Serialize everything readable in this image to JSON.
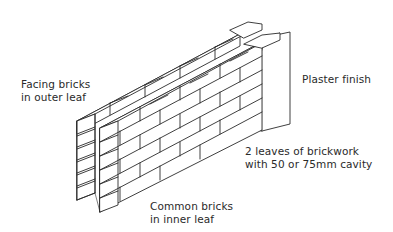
{
  "diagram": {
    "stroke_color": "#2a2a2a",
    "background": "#ffffff",
    "components": [
      "outer leaf",
      "inner leaf",
      "cavity",
      "plaster finish"
    ]
  },
  "labels": {
    "facing": {
      "line1": "Facing bricks",
      "line2": "in outer leaf"
    },
    "plaster": {
      "line1": "Plaster finish"
    },
    "leaves": {
      "line1": "2 leaves of brickwork",
      "line2": "with 50 or 75mm cavity"
    },
    "common": {
      "line1": "Common bricks",
      "line2": "in inner leaf"
    }
  }
}
